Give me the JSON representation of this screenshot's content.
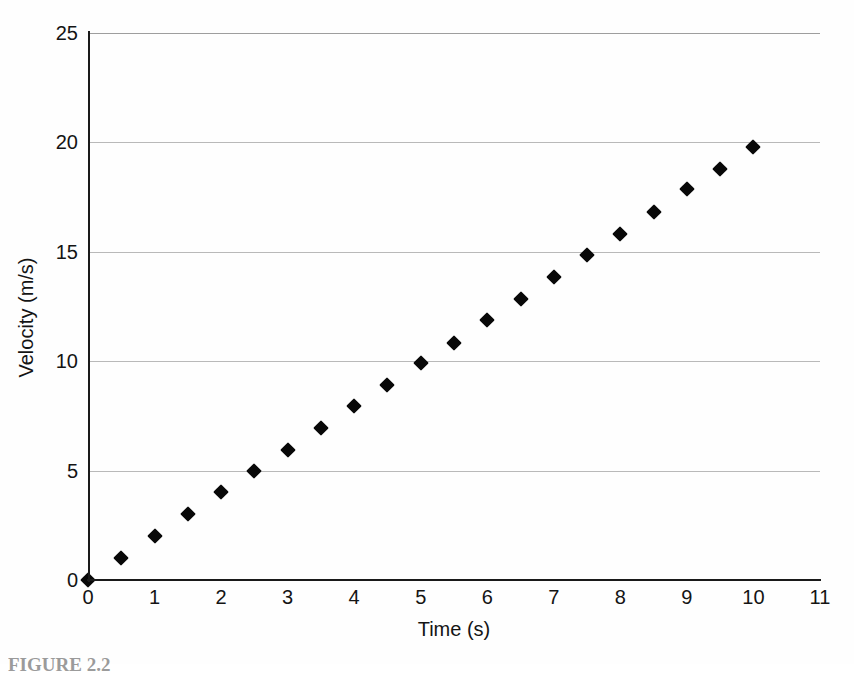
{
  "figure": {
    "caption_fragment": "FIGURE 2.2",
    "background_color": "#fefefe",
    "marker_color": "#080808",
    "gridline_color": "#b9b9b9",
    "axis_color": "#1a1a1a"
  },
  "chart_data": {
    "type": "scatter",
    "title": "",
    "xlabel": "Time (s)",
    "ylabel": "Velocity (m/s)",
    "xlim": [
      0,
      11
    ],
    "ylim": [
      0,
      25
    ],
    "xticks": [
      0,
      1,
      2,
      3,
      4,
      5,
      6,
      7,
      8,
      9,
      10,
      11
    ],
    "xtick_labels": [
      "0",
      "1",
      "2",
      "3",
      "4",
      "5",
      "6",
      "7",
      "8",
      "9",
      "10",
      "11"
    ],
    "yticks": [
      0,
      5,
      10,
      15,
      20,
      25
    ],
    "ytick_labels": [
      "0",
      "5",
      "10",
      "15",
      "20",
      "25"
    ],
    "gridlines": {
      "horizontal": [
        5,
        10,
        15,
        20,
        25
      ],
      "vertical": []
    },
    "grid": true,
    "legend": null,
    "marker": "diamond",
    "x": [
      0,
      0.5,
      1,
      1.5,
      2,
      2.5,
      3,
      3.5,
      4,
      4.5,
      5,
      5.5,
      6,
      6.5,
      7,
      7.5,
      8,
      8.5,
      9,
      9.5,
      10
    ],
    "y": [
      0,
      1,
      2,
      3,
      4,
      5,
      5.95,
      6.95,
      7.95,
      8.9,
      9.9,
      10.85,
      11.9,
      12.85,
      13.85,
      14.85,
      15.8,
      16.8,
      17.85,
      18.8,
      19.8
    ],
    "annotations": []
  }
}
